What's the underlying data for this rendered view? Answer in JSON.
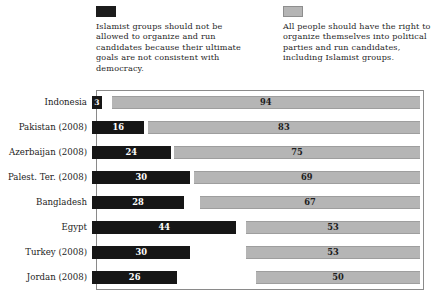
{
  "legend": {
    "entries": [
      {
        "swatch_name": "legend-swatch-dark",
        "color": "#161616",
        "text": "Islamist groups should not be allowed to organize and run candidates because their ultimate goals are not consistent with democracy."
      },
      {
        "swatch_name": "legend-swatch-light",
        "color": "#b5b5b5",
        "text": "All people should have the right to organize themselves into political parties and run candidates, including Islamist groups."
      }
    ]
  },
  "chart_data": {
    "type": "bar",
    "subtype": "stacked-horizontal-100",
    "title": "",
    "subtitle": "",
    "xlabel": "",
    "ylabel": "",
    "xlim": [
      0,
      100
    ],
    "grid": false,
    "legend_position": "top",
    "value_unit": "percent",
    "categories": [
      "Indonesia",
      "Pakistan (2008)",
      "Azerbaijan (2008)",
      "Palest. Ter. (2008)",
      "Bangladesh",
      "Egypt",
      "Turkey (2008)",
      "Jordan (2008)"
    ],
    "series": [
      {
        "name": "Islamist groups should not be allowed to organize and run candidates because their ultimate goals are not consistent with democracy.",
        "color": "#161616",
        "values": [
          3,
          16,
          24,
          30,
          28,
          44,
          30,
          26
        ]
      },
      {
        "name": "All people should have the right to organize themselves into political parties and run candidates, including Islamist groups.",
        "color": "#b5b5b5",
        "values": [
          94,
          83,
          75,
          69,
          67,
          53,
          53,
          50
        ]
      }
    ]
  }
}
